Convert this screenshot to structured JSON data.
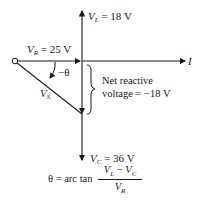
{
  "diagram": {
    "type": "phasor diagram",
    "phasors": {
      "VL": {
        "symbol": "V",
        "subscript": "L",
        "value": "= 18 V"
      },
      "VR": {
        "symbol": "V",
        "subscript": "R",
        "value": "= 25 V"
      },
      "VC": {
        "symbol": "V",
        "subscript": "C",
        "value": "= 36 V"
      },
      "VS": {
        "symbol": "V",
        "subscript": "S"
      },
      "I": {
        "symbol": "I"
      }
    },
    "angle_label": "−θ",
    "net_reactive": {
      "line1": "Net reactive",
      "line2": "voltage = −18 V"
    },
    "formula": {
      "lhs": "θ = arc tan",
      "numerator": "V_L − V_C",
      "numerator_a": "V",
      "numerator_a_sub": "L",
      "minus": " − ",
      "numerator_b": "V",
      "numerator_b_sub": "C",
      "denominator": "V",
      "denominator_sub": "R"
    },
    "colors": {
      "stroke": "#1a1a1a",
      "background": "#ffffff"
    }
  }
}
